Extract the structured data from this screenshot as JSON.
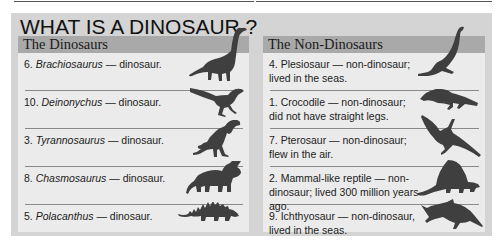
{
  "title": "WHAT IS A DINOSAUR ?",
  "columns": {
    "dinosaurs": {
      "header": "The Dinosaurs",
      "items": [
        {
          "number": "6.",
          "name": "Brachiosaurus",
          "verdict": "— dinosaur.",
          "icon": "brachiosaurus-silhouette-icon"
        },
        {
          "number": "10.",
          "name": "Deinonychus",
          "verdict": "— dinosaur.",
          "icon": "deinonychus-silhouette-icon"
        },
        {
          "number": "3.",
          "name": "Tyrannosaurus",
          "verdict": "— dinosaur.",
          "icon": "tyrannosaurus-silhouette-icon"
        },
        {
          "number": "8.",
          "name": "Chasmosaurus",
          "verdict": "— dinosaur.",
          "icon": "chasmosaurus-silhouette-icon"
        },
        {
          "number": "5.",
          "name": "Polacanthus",
          "verdict": "— dinosaur.",
          "icon": "polacanthus-silhouette-icon"
        }
      ]
    },
    "non_dinosaurs": {
      "header": "The Non-Dinosaurs",
      "items": [
        {
          "text": "4. Plesiosaur — non-dinosaur; lived in the seas.",
          "icon": "plesiosaur-silhouette-icon"
        },
        {
          "text": "1. Crocodile — non-dinosaur; did not have straight legs.",
          "icon": "crocodile-silhouette-icon"
        },
        {
          "text": "7. Pterosaur — non-dinosaur; flew in the air.",
          "icon": "pterosaur-silhouette-icon"
        },
        {
          "text": "2. Mammal-like reptile — non-dinosaur; lived 300 million years ago.",
          "icon": "mammal-like-reptile-silhouette-icon"
        },
        {
          "text": "9. Ichthyosaur — non-dinosaur, lived in the seas.",
          "icon": "ichthyosaur-silhouette-icon"
        }
      ]
    }
  },
  "colors": {
    "panel_bg": "#d4d4d4",
    "column_bg": "#ebebeb",
    "header_band": "#a9a9a9",
    "silhouette": "#3f3f3f"
  }
}
